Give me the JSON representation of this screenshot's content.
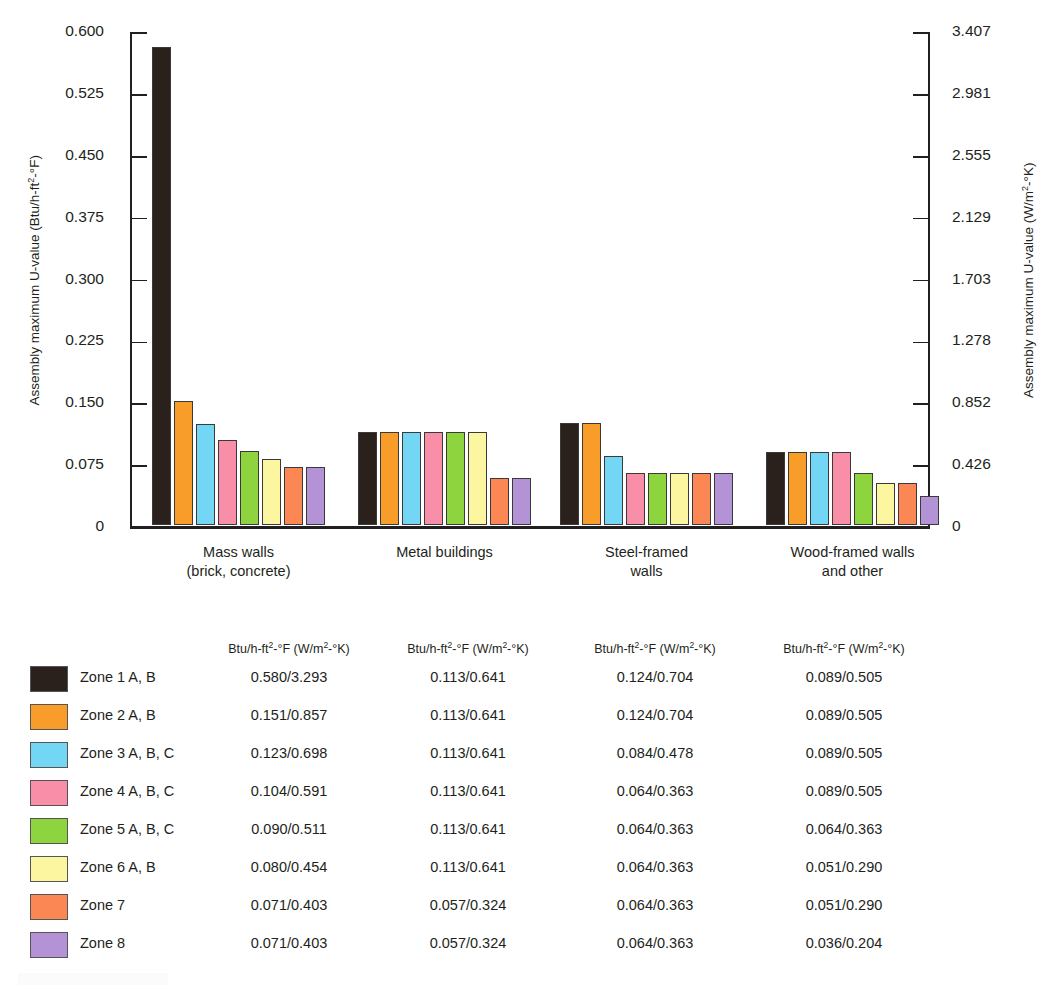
{
  "chart_data": {
    "type": "bar",
    "title": "",
    "xlabel": "",
    "ylabel": "Assembly maximum U-value (Btu/h-ft²-°F)",
    "ylabel_right": "Assembly maximum U-value (W/m²-°K)",
    "ylim": [
      0,
      0.6
    ],
    "ylim_right": [
      0,
      3.407
    ],
    "grid": false,
    "legend_position": "below-as-table",
    "ytick_labels": [
      "0.600",
      "0.525",
      "0.450",
      "0.375",
      "0.300",
      "0.225",
      "0.150",
      "0.075",
      "0"
    ],
    "ytick_values": [
      0.6,
      0.525,
      0.45,
      0.375,
      0.3,
      0.225,
      0.15,
      0.075,
      0
    ],
    "ytick_labels_right": [
      "3.407",
      "2.981",
      "2.555",
      "2.129",
      "1.703",
      "1.278",
      "0.852",
      "0.426",
      "0"
    ],
    "ytick_values_right": [
      3.407,
      2.981,
      2.555,
      2.129,
      1.703,
      1.278,
      0.852,
      0.426,
      0
    ],
    "categories": [
      "Mass walls (brick, concrete)",
      "Metal buildings",
      "Steel-framed walls",
      "Wood-framed walls and other"
    ],
    "category_lines": [
      [
        "Mass walls",
        "(brick, concrete)"
      ],
      [
        "Metal buildings"
      ],
      [
        "Steel-framed",
        "walls"
      ],
      [
        "Wood-framed walls",
        "and other"
      ]
    ],
    "series": [
      {
        "name": "Zone 1 A, B",
        "color": "#2b211c",
        "values": [
          0.58,
          0.113,
          0.124,
          0.089
        ],
        "values_si": [
          3.293,
          0.641,
          0.704,
          0.505
        ]
      },
      {
        "name": "Zone 2 A, B",
        "color": "#f99d2a",
        "values": [
          0.151,
          0.113,
          0.124,
          0.089
        ],
        "values_si": [
          0.857,
          0.641,
          0.704,
          0.505
        ]
      },
      {
        "name": "Zone 3 A, B, C",
        "color": "#72d6f4",
        "values": [
          0.123,
          0.113,
          0.084,
          0.089
        ],
        "values_si": [
          0.698,
          0.641,
          0.478,
          0.505
        ]
      },
      {
        "name": "Zone 4 A, B, C",
        "color": "#f98ea8",
        "values": [
          0.104,
          0.113,
          0.064,
          0.089
        ],
        "values_si": [
          0.591,
          0.641,
          0.363,
          0.505
        ]
      },
      {
        "name": "Zone 5 A, B, C",
        "color": "#8ed43f",
        "values": [
          0.09,
          0.113,
          0.064,
          0.064
        ],
        "values_si": [
          0.511,
          0.641,
          0.363,
          0.363
        ]
      },
      {
        "name": "Zone 6 A, B",
        "color": "#fcf6a0",
        "values": [
          0.08,
          0.113,
          0.064,
          0.051
        ],
        "values_si": [
          0.454,
          0.641,
          0.363,
          0.29
        ]
      },
      {
        "name": "Zone 7",
        "color": "#fb8755",
        "values": [
          0.071,
          0.057,
          0.064,
          0.051
        ],
        "values_si": [
          0.403,
          0.324,
          0.363,
          0.29
        ]
      },
      {
        "name": "Zone 8",
        "color": "#b392d6",
        "values": [
          0.071,
          0.057,
          0.064,
          0.036
        ],
        "values_si": [
          0.403,
          0.324,
          0.363,
          0.204
        ]
      }
    ]
  },
  "axes": {
    "left_title_pre": "Assembly maximum U-value (Btu/h-ft",
    "left_title_sup": "2",
    "left_title_post": "-°F)",
    "right_title_pre": "Assembly maximum U-value (W/m",
    "right_title_sup": "2",
    "right_title_post": "-°K)"
  },
  "table": {
    "column_header_pre": "Btu/h-ft",
    "column_header_sup1": "2",
    "column_header_mid": "-°F (W/m",
    "column_header_sup2": "2",
    "column_header_post": "-°K)",
    "column_headers": [
      "Btu/h-ft²-°F (W/m²-°K)",
      "Btu/h-ft²-°F (W/m²-°K)",
      "Btu/h-ft²-°F (W/m²-°K)",
      "Btu/h-ft²-°F (W/m²-°K)"
    ],
    "rows": [
      {
        "zone": "Zone 1 A, B",
        "color": "#2b211c",
        "cells": [
          "0.580/3.293",
          "0.113/0.641",
          "0.124/0.704",
          "0.089/0.505"
        ]
      },
      {
        "zone": "Zone 2 A, B",
        "color": "#f99d2a",
        "cells": [
          "0.151/0.857",
          "0.113/0.641",
          "0.124/0.704",
          "0.089/0.505"
        ]
      },
      {
        "zone": "Zone 3 A, B, C",
        "color": "#72d6f4",
        "cells": [
          "0.123/0.698",
          "0.113/0.641",
          "0.084/0.478",
          "0.089/0.505"
        ]
      },
      {
        "zone": "Zone 4 A, B, C",
        "color": "#f98ea8",
        "cells": [
          "0.104/0.591",
          "0.113/0.641",
          "0.064/0.363",
          "0.089/0.505"
        ]
      },
      {
        "zone": "Zone 5 A, B, C",
        "color": "#8ed43f",
        "cells": [
          "0.090/0.511",
          "0.113/0.641",
          "0.064/0.363",
          "0.064/0.363"
        ]
      },
      {
        "zone": "Zone 6 A, B",
        "color": "#fcf6a0",
        "cells": [
          "0.080/0.454",
          "0.113/0.641",
          "0.064/0.363",
          "0.051/0.290"
        ]
      },
      {
        "zone": "Zone 7",
        "color": "#fb8755",
        "cells": [
          "0.071/0.403",
          "0.057/0.324",
          "0.064/0.363",
          "0.051/0.290"
        ]
      },
      {
        "zone": "Zone 8",
        "color": "#b392d6",
        "cells": [
          "0.071/0.403",
          "0.057/0.324",
          "0.064/0.363",
          "0.036/0.204"
        ]
      }
    ]
  }
}
